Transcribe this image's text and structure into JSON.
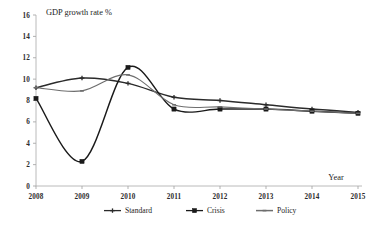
{
  "chart_data": {
    "type": "line",
    "title": "GDP growth rate %",
    "xlabel": "Year",
    "ylabel": "",
    "categories": [
      "2008",
      "2009",
      "2010",
      "2011",
      "2012",
      "2013",
      "2014",
      "2015"
    ],
    "x": [
      2008,
      2009,
      2010,
      2011,
      2012,
      2013,
      2014,
      2015
    ],
    "xlim": [
      2008,
      2015
    ],
    "ylim": [
      0,
      16
    ],
    "ytick_labels": [
      "0",
      "2",
      "4",
      "6",
      "8",
      "10",
      "12",
      "14",
      "16"
    ],
    "ytick_values": [
      0,
      2,
      4,
      6,
      8,
      10,
      12,
      14,
      16
    ],
    "grid": true,
    "legend_position": "bottom",
    "series": [
      {
        "name": "Standard",
        "marker": "cross",
        "color": "#2b2b2b",
        "values": [
          9.2,
          10.1,
          9.6,
          8.3,
          8.0,
          7.6,
          7.2,
          6.9
        ]
      },
      {
        "name": "Crisis",
        "marker": "square",
        "color": "#1a1a1a",
        "values": [
          8.2,
          2.3,
          11.1,
          7.2,
          7.2,
          7.2,
          7.0,
          6.8
        ]
      },
      {
        "name": "Policy",
        "marker": "line",
        "color": "#6e6e6e",
        "values": [
          9.2,
          8.9,
          10.4,
          7.6,
          7.4,
          7.2,
          7.0,
          6.8
        ]
      }
    ]
  },
  "axis": {
    "y_title": "GDP growth rate %",
    "x_title": "Year"
  },
  "legend": {
    "items": [
      {
        "label": "Standard"
      },
      {
        "label": "Crisis"
      },
      {
        "label": "Policy"
      }
    ]
  }
}
